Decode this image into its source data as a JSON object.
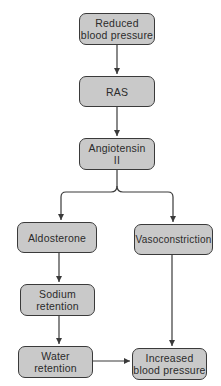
{
  "diagram": {
    "type": "flowchart",
    "colors": {
      "box_fill": "#c9c9c9",
      "box_border": "#3a3a3a",
      "arrow": "#3a3a3a",
      "text": "#2b2b2b"
    },
    "nodes": {
      "reduced_bp": {
        "label": "Reduced\nblood pressure"
      },
      "ras": {
        "label": "RAS"
      },
      "angiotensin": {
        "label": "Angiotensin\nII"
      },
      "aldosterone": {
        "label": "Aldosterone"
      },
      "vasoconstriction": {
        "label": "Vasoconstriction"
      },
      "sodium": {
        "label": "Sodium\nretention"
      },
      "water": {
        "label": "Water\nretention"
      },
      "increased_bp": {
        "label": "Increased\nblood pressure"
      }
    },
    "edges": [
      {
        "from": "reduced_bp",
        "to": "ras"
      },
      {
        "from": "ras",
        "to": "angiotensin"
      },
      {
        "from": "angiotensin",
        "to": "aldosterone"
      },
      {
        "from": "angiotensin",
        "to": "vasoconstriction"
      },
      {
        "from": "aldosterone",
        "to": "sodium"
      },
      {
        "from": "sodium",
        "to": "water"
      },
      {
        "from": "water",
        "to": "increased_bp"
      },
      {
        "from": "vasoconstriction",
        "to": "increased_bp"
      }
    ]
  }
}
